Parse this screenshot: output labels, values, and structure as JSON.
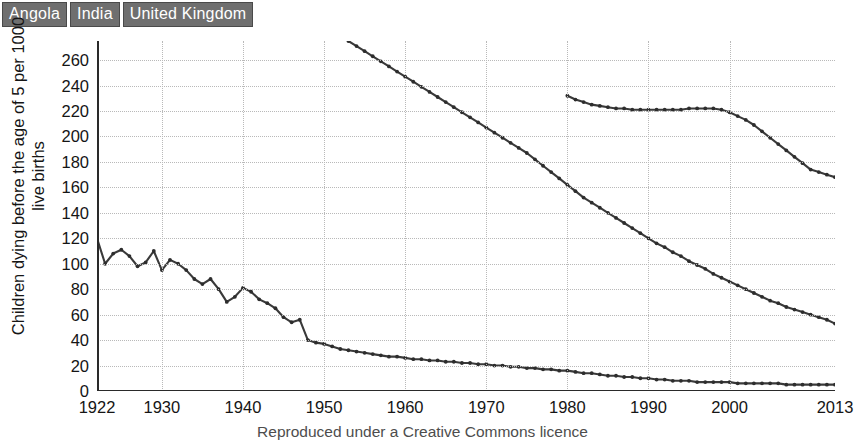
{
  "legend": {
    "position": "top-left",
    "items": [
      {
        "label": "Angola",
        "color": "#6f6f6f"
      },
      {
        "label": "India",
        "color": "#6f6f6f"
      },
      {
        "label": "United Kingdom",
        "color": "#6f6f6f"
      }
    ]
  },
  "caption": "Reproduced under a Creative Commons licence",
  "chart_data": {
    "type": "line",
    "title": "",
    "xlabel": "",
    "ylabel": "Children dying before the age of 5 per 1000 live births",
    "ylabel_lines": [
      "Children dying before the age of 5 per 1000",
      "live births"
    ],
    "xlim": [
      1922,
      2013
    ],
    "ylim": [
      0,
      275
    ],
    "grid": true,
    "line_color": "#3a3a3a",
    "marker": "circle",
    "ytick_labels": [
      "0",
      "20",
      "40",
      "60",
      "80",
      "100",
      "120",
      "140",
      "160",
      "180",
      "200",
      "220",
      "240",
      "260"
    ],
    "yticks": [
      0,
      20,
      40,
      60,
      80,
      100,
      120,
      140,
      160,
      180,
      200,
      220,
      240,
      260
    ],
    "xtick_labels": [
      "1922",
      "1930",
      "1940",
      "1950",
      "1960",
      "1970",
      "1980",
      "1990",
      "2000",
      "2013"
    ],
    "xticks": [
      1922,
      1930,
      1940,
      1950,
      1960,
      1970,
      1980,
      1990,
      2000,
      2013
    ],
    "series": [
      {
        "name": "Angola",
        "x": [
          1980,
          1981,
          1982,
          1983,
          1984,
          1985,
          1986,
          1987,
          1988,
          1989,
          1990,
          1991,
          1992,
          1993,
          1994,
          1995,
          1996,
          1997,
          1998,
          1999,
          2000,
          2001,
          2002,
          2003,
          2004,
          2005,
          2006,
          2007,
          2008,
          2009,
          2010,
          2011,
          2012,
          2013
        ],
        "values": [
          232,
          229,
          227,
          225,
          224,
          223,
          222,
          222,
          221,
          221,
          221,
          221,
          221,
          221,
          221,
          222,
          222,
          222,
          222,
          221,
          219,
          216,
          213,
          209,
          204,
          199,
          194,
          189,
          184,
          179,
          174,
          172,
          170,
          168
        ]
      },
      {
        "name": "India",
        "x": [
          1953,
          1954,
          1955,
          1956,
          1957,
          1958,
          1959,
          1960,
          1961,
          1962,
          1963,
          1964,
          1965,
          1966,
          1967,
          1968,
          1969,
          1970,
          1971,
          1972,
          1973,
          1974,
          1975,
          1976,
          1977,
          1978,
          1979,
          1980,
          1981,
          1982,
          1983,
          1984,
          1985,
          1986,
          1987,
          1988,
          1989,
          1990,
          1991,
          1992,
          1993,
          1994,
          1995,
          1996,
          1997,
          1998,
          1999,
          2000,
          2001,
          2002,
          2003,
          2004,
          2005,
          2006,
          2007,
          2008,
          2009,
          2010,
          2011,
          2012,
          2013
        ],
        "values": [
          275,
          271,
          267,
          263,
          259,
          255,
          251,
          247,
          243,
          239,
          235,
          231,
          227,
          223,
          219,
          215,
          211,
          207,
          203,
          199,
          195,
          191,
          187,
          182,
          177,
          172,
          167,
          162,
          157,
          152,
          148,
          144,
          140,
          136,
          132,
          128,
          124,
          120,
          116,
          113,
          109,
          106,
          102,
          99,
          96,
          92,
          89,
          86,
          83,
          80,
          77,
          74,
          71,
          69,
          66,
          64,
          62,
          60,
          58,
          56,
          53
        ]
      },
      {
        "name": "United Kingdom",
        "x": [
          1922,
          1923,
          1924,
          1925,
          1926,
          1927,
          1928,
          1929,
          1930,
          1931,
          1932,
          1933,
          1934,
          1935,
          1936,
          1937,
          1938,
          1939,
          1940,
          1941,
          1942,
          1943,
          1944,
          1945,
          1946,
          1947,
          1948,
          1949,
          1950,
          1951,
          1952,
          1953,
          1954,
          1955,
          1956,
          1957,
          1958,
          1959,
          1960,
          1961,
          1962,
          1963,
          1964,
          1965,
          1966,
          1967,
          1968,
          1969,
          1970,
          1971,
          1972,
          1973,
          1974,
          1975,
          1976,
          1977,
          1978,
          1979,
          1980,
          1981,
          1982,
          1983,
          1984,
          1985,
          1986,
          1987,
          1988,
          1989,
          1990,
          1991,
          1992,
          1993,
          1994,
          1995,
          1996,
          1997,
          1998,
          1999,
          2000,
          2001,
          2002,
          2003,
          2004,
          2005,
          2006,
          2007,
          2008,
          2009,
          2010,
          2011,
          2012,
          2013
        ],
        "values": [
          120,
          100,
          108,
          111,
          106,
          98,
          101,
          110,
          95,
          103,
          100,
          95,
          88,
          84,
          88,
          80,
          70,
          74,
          81,
          78,
          72,
          69,
          65,
          58,
          54,
          56,
          40,
          38,
          37,
          35,
          33,
          32,
          31,
          30,
          29,
          28,
          27,
          27,
          26,
          25,
          25,
          24,
          24,
          23,
          23,
          22,
          22,
          21,
          21,
          20,
          20,
          19,
          19,
          18,
          18,
          17,
          17,
          16,
          16,
          15,
          14,
          14,
          13,
          12,
          12,
          11,
          11,
          10,
          10,
          9,
          9,
          8,
          8,
          8,
          7,
          7,
          7,
          7,
          7,
          6,
          6,
          6,
          6,
          6,
          6,
          5,
          5,
          5,
          5,
          5,
          5,
          5
        ]
      }
    ]
  }
}
